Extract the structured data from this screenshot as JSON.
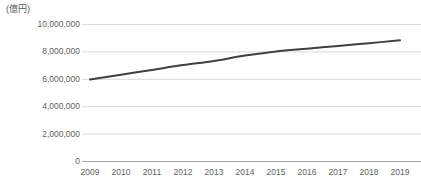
{
  "chart_data": {
    "type": "line",
    "title": "",
    "subtitle": "",
    "unit_label": "(億円)",
    "xlabel": "",
    "ylabel": "",
    "categories": [
      "2009",
      "2010",
      "2011",
      "2012",
      "2013",
      "2014",
      "2015",
      "2016",
      "2017",
      "2018",
      "2019"
    ],
    "x": [
      2009,
      2010,
      2011,
      2012,
      2013,
      2014,
      2015,
      2016,
      2017,
      2018,
      2019
    ],
    "values": [
      5950000,
      6300000,
      6650000,
      7000000,
      7300000,
      7700000,
      8000000,
      8200000,
      8400000,
      8600000,
      8810000
    ],
    "series": [
      {
        "name": "",
        "color": "#404040",
        "values": [
          5950000,
          6300000,
          6650000,
          7000000,
          7300000,
          7700000,
          8000000,
          8200000,
          8400000,
          8600000,
          8810000
        ]
      }
    ],
    "ylim": [
      0,
      10000000
    ],
    "yticks": [
      0,
      2000000,
      4000000,
      6000000,
      8000000,
      10000000
    ],
    "ytick_labels": [
      "0",
      "2,000,000",
      "4,000,000",
      "6,000,000",
      "8,000,000",
      "10,000,000"
    ],
    "grid": true,
    "grid_axis": "y",
    "grid_color": "#d9d9d9",
    "axis_color": "#a6a6a6",
    "legend": false,
    "legend_position": "none",
    "markers": false,
    "line_width": 2
  },
  "plot_geometry": {
    "x_left": 90,
    "x_right": 400,
    "y_zero": 161,
    "y_top": 24
  }
}
